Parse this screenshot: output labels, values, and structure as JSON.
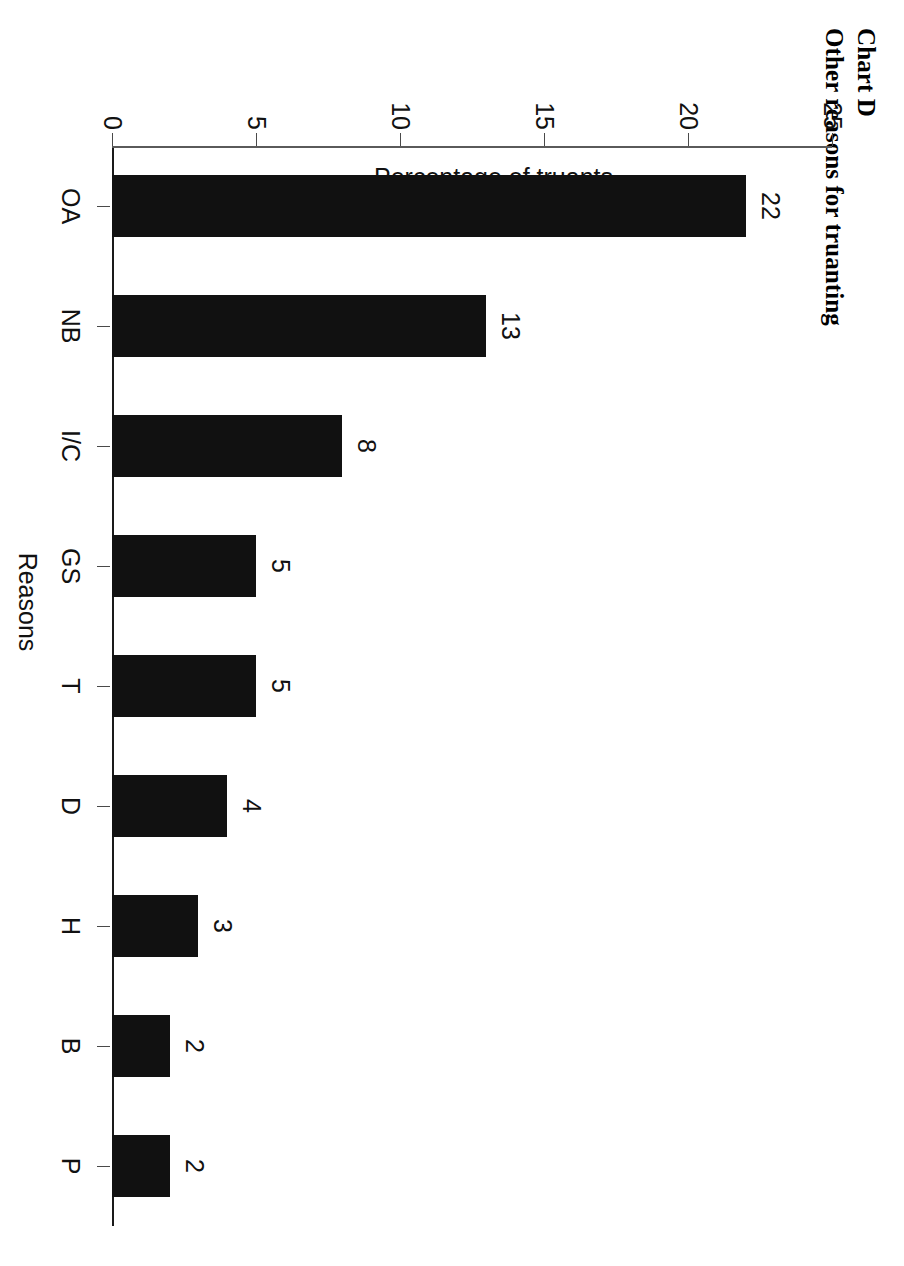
{
  "title": {
    "line1": "Chart D",
    "line2": "Other reasons for truanting"
  },
  "chart_data": {
    "type": "bar",
    "title": "Other reasons for truanting",
    "subtitle": "Chart D",
    "categories": [
      "OA",
      "NB",
      "I/C",
      "GS",
      "T",
      "D",
      "H",
      "B",
      "P"
    ],
    "values": [
      22,
      13,
      8,
      5,
      5,
      4,
      3,
      2,
      2
    ],
    "data_labels": [
      "22",
      "13",
      "8",
      "5",
      "5",
      "4",
      "3",
      "2",
      "2"
    ],
    "xlabel": "Reasons",
    "ylabel": "Percentage of truants",
    "ylim": [
      0,
      25
    ],
    "yticks": [
      0,
      5,
      10,
      15,
      20,
      25
    ],
    "ytick_labels": [
      "0",
      "5",
      "10",
      "15",
      "20",
      "25"
    ],
    "grid": false,
    "legend": false,
    "bar_color": "#111111",
    "orientation": "vertical-rotated-90cw"
  }
}
